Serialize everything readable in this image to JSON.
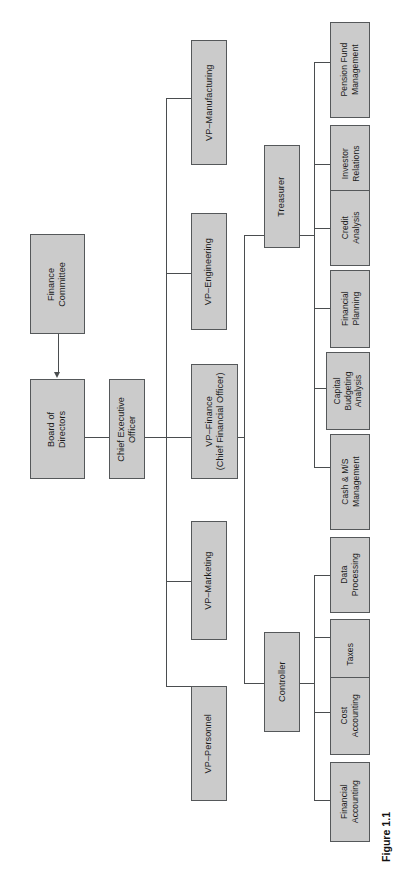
{
  "figure": {
    "caption": "Figure 1.1",
    "orientation": "rotated-90-counterclockwise",
    "box_fill_color": "#cbcbcb",
    "box_border_color": "#55585a",
    "line_color": "#4a4d4f",
    "background_color": "#ffffff",
    "text_color": "#1b1b1b"
  },
  "nodes": {
    "finance_committee": "Finance\nCommittee",
    "board_of_directors": "Board of\nDirectors",
    "chief_executive_officer": "Chief Executive\nOfficer",
    "vp_personnel": "VP–Personnel",
    "vp_marketing": "VP–Marketing",
    "vp_finance": "VP–Finance\n(Chief Financial Officer)",
    "vp_engineering": "VP–Engineering",
    "vp_manufacturing": "VP–Manufacturing",
    "controller": "Controller",
    "treasurer": "Treasurer",
    "financial_accounting": "Financial\nAccounting",
    "cost_accounting": "Cost\nAccounting",
    "taxes": "Taxes",
    "data_processing": "Data\nProcessing",
    "cash_ms_management": "Cash & M/S\nManagement",
    "capital_budgeting_analysis": "Capital\nBudgeting\nAnalysis",
    "financial_planning": "Financial\nPlanning",
    "credit_analysis": "Credit\nAnalysis",
    "investor_relations": "Investor\nRelations",
    "pension_fund_management": "Pension Fund\nManagement"
  },
  "hierarchy": {
    "root": "board_of_directors",
    "advisory": {
      "from": "finance_committee",
      "to": "board_of_directors"
    },
    "edges": [
      {
        "parent": "board_of_directors",
        "child": "chief_executive_officer"
      },
      {
        "parent": "chief_executive_officer",
        "child": "vp_personnel"
      },
      {
        "parent": "chief_executive_officer",
        "child": "vp_marketing"
      },
      {
        "parent": "chief_executive_officer",
        "child": "vp_finance"
      },
      {
        "parent": "chief_executive_officer",
        "child": "vp_engineering"
      },
      {
        "parent": "chief_executive_officer",
        "child": "vp_manufacturing"
      },
      {
        "parent": "vp_finance",
        "child": "controller"
      },
      {
        "parent": "vp_finance",
        "child": "treasurer"
      },
      {
        "parent": "controller",
        "child": "financial_accounting"
      },
      {
        "parent": "controller",
        "child": "cost_accounting"
      },
      {
        "parent": "controller",
        "child": "taxes"
      },
      {
        "parent": "controller",
        "child": "data_processing"
      },
      {
        "parent": "treasurer",
        "child": "cash_ms_management"
      },
      {
        "parent": "treasurer",
        "child": "capital_budgeting_analysis"
      },
      {
        "parent": "treasurer",
        "child": "financial_planning"
      },
      {
        "parent": "treasurer",
        "child": "credit_analysis"
      },
      {
        "parent": "treasurer",
        "child": "investor_relations"
      },
      {
        "parent": "treasurer",
        "child": "pension_fund_management"
      }
    ]
  }
}
